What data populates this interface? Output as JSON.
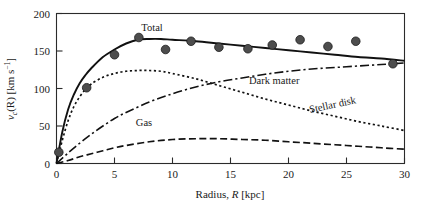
{
  "chart_data": {
    "type": "line",
    "title": "",
    "xlabel": "Radius, R [kpc]",
    "ylabel": "v_c(R) [km s^-1]",
    "xlim": [
      0,
      30
    ],
    "ylim": [
      0,
      200
    ],
    "xticks": [
      0,
      5,
      10,
      15,
      20,
      25,
      30
    ],
    "xtick_labels": [
      "0",
      "5",
      "10",
      "15",
      "20",
      "25",
      "30"
    ],
    "yticks": [
      0,
      50,
      100,
      150,
      200
    ],
    "ytick_labels": [
      "0",
      "50",
      "100",
      "150",
      "200"
    ],
    "grid": false,
    "legend_position": "inline-annotations",
    "series": [
      {
        "name": "Total",
        "style": "solid",
        "label": "Total",
        "x": [
          0,
          0.5,
          1,
          1.5,
          2,
          2.5,
          3,
          4,
          5,
          6,
          7,
          8,
          9,
          10,
          12,
          14,
          16,
          18,
          20,
          22,
          24,
          26,
          28,
          30
        ],
        "values": [
          0,
          42,
          72,
          92,
          107,
          118,
          127,
          142,
          152,
          160,
          165,
          166,
          166,
          165,
          163,
          160,
          157,
          154,
          151,
          148,
          145,
          142,
          140,
          137
        ]
      },
      {
        "name": "Dark matter",
        "style": "dash-dot",
        "label": "Dark matter",
        "x": [
          0,
          1,
          2,
          3,
          4,
          5,
          6,
          8,
          10,
          12,
          14,
          16,
          18,
          20,
          22,
          24,
          26,
          28,
          30
        ],
        "values": [
          0,
          14,
          27,
          39,
          50,
          60,
          68,
          82,
          93,
          102,
          109,
          114,
          119,
          123,
          126,
          128,
          130,
          132,
          134
        ]
      },
      {
        "name": "Stellar disk",
        "style": "dotted",
        "label": "Stellar disk",
        "x": [
          0,
          0.5,
          1,
          1.5,
          2,
          2.5,
          3,
          4,
          5,
          6,
          7,
          8,
          9,
          10,
          12,
          14,
          16,
          18,
          20,
          22,
          24,
          26,
          28,
          30
        ],
        "values": [
          0,
          31,
          57,
          76,
          89,
          99,
          106,
          115,
          120,
          123,
          124,
          124,
          123,
          120,
          113,
          104,
          95,
          86,
          78,
          70,
          63,
          56,
          50,
          44
        ]
      },
      {
        "name": "Gas",
        "style": "dashed",
        "label": "Gas",
        "x": [
          0,
          1,
          2,
          3,
          4,
          5,
          6,
          8,
          10,
          12,
          14,
          16,
          18,
          20,
          22,
          24,
          26,
          28,
          30
        ],
        "values": [
          0,
          4,
          9,
          13,
          17,
          21,
          24,
          29,
          32,
          33,
          33,
          32,
          31,
          29,
          27,
          25,
          23,
          21,
          19
        ]
      }
    ],
    "datapoints": {
      "name": "Observed rotation velocities",
      "marker": "filled-circle",
      "color": "#4d4d4d",
      "x": [
        0.2,
        2.6,
        5.0,
        7.1,
        9.4,
        11.6,
        14.0,
        16.5,
        18.6,
        21.0,
        23.4,
        25.8,
        29.0
      ],
      "values": [
        15,
        101,
        145,
        168,
        152,
        163,
        155,
        153,
        158,
        165,
        156,
        163,
        133
      ]
    },
    "annotations": [
      {
        "text": "Total",
        "x_px": 152,
        "y_px": 31,
        "rotation": 0
      },
      {
        "text": "Dark matter",
        "x_px": 249,
        "y_px": 84,
        "rotation": 0
      },
      {
        "text": "Stellar disk",
        "x_px": 310,
        "y_px": 113,
        "rotation": -12
      },
      {
        "text": "Gas",
        "x_px": 144,
        "y_px": 126,
        "rotation": 0
      }
    ]
  },
  "axes": {
    "y_label_parts": {
      "v": "v",
      "sub_c": "c",
      "paren": "(R) [km s",
      "sup": "−1",
      "close": "]"
    },
    "x_label_parts": {
      "prefix": "Radius, ",
      "italic": "R",
      "suffix": " [kpc]"
    }
  }
}
